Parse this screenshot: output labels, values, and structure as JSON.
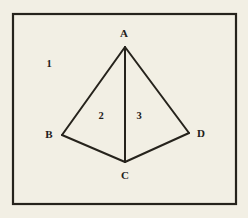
{
  "figure": {
    "background_color": "#f2efe4",
    "stroke_color": "#26231c",
    "label_color": "#22201a",
    "frame": {
      "x": 13,
      "y": 14,
      "width": 223,
      "height": 190,
      "stroke_width": 2.2
    },
    "stroke_width": 2.0,
    "vertices": [
      {
        "id": "A",
        "label": "A",
        "x": 125,
        "y": 47,
        "label_x": 124,
        "label_y": 33
      },
      {
        "id": "B",
        "label": "B",
        "x": 62,
        "y": 135,
        "label_x": 49,
        "label_y": 134
      },
      {
        "id": "C",
        "label": "C",
        "x": 125,
        "y": 162,
        "label_x": 125,
        "label_y": 175
      },
      {
        "id": "D",
        "label": "D",
        "x": 189,
        "y": 133,
        "label_x": 201,
        "label_y": 133
      }
    ],
    "edges": [
      {
        "id": "AB",
        "from": "A",
        "to": "B",
        "x1": 125,
        "y1": 47,
        "x2": 62,
        "y2": 135
      },
      {
        "id": "AC",
        "from": "A",
        "to": "C",
        "x1": 125,
        "y1": 47,
        "x2": 125,
        "y2": 162
      },
      {
        "id": "AD",
        "from": "A",
        "to": "D",
        "x1": 125,
        "y1": 47,
        "x2": 189,
        "y2": 133
      },
      {
        "id": "BC",
        "from": "B",
        "to": "C",
        "x1": 62,
        "y1": 135,
        "x2": 125,
        "y2": 162
      },
      {
        "id": "CD",
        "from": "C",
        "to": "D",
        "x1": 125,
        "y1": 162,
        "x2": 189,
        "y2": 133
      }
    ],
    "region_labels": [
      {
        "id": "region-1",
        "label": "1",
        "x": 49,
        "y": 64
      },
      {
        "id": "region-2",
        "label": "2",
        "x": 101,
        "y": 116
      },
      {
        "id": "region-3",
        "label": "3",
        "x": 139,
        "y": 116
      }
    ]
  }
}
